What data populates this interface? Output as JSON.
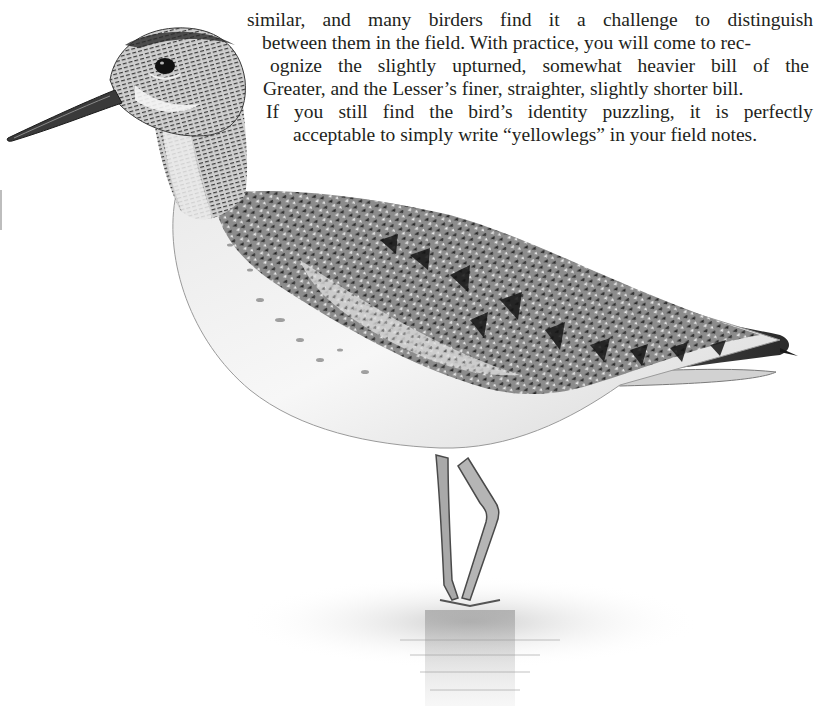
{
  "document": {
    "type": "field-guide-page",
    "subject_illustration": "yellowlegs-sandpiper-standing-in-shallow-water",
    "paragraph": {
      "lines": [
        "similar, and many birders find it a challenge to distinguish",
        "between them in the field. With practice, you will come to rec-",
        "ognize the slightly upturned, somewhat heavier bill of the",
        "Greater, and the Lesser’s finer, straighter, slightly shorter bill.",
        "If you still find the bird’s identity puzzling, it is perfectly",
        "acceptable to simply write “yellowlegs” in your field notes."
      ]
    }
  },
  "colors": {
    "background": "#ffffff",
    "text": "#231f20",
    "ink_dark": "#1a1a1a",
    "ink_mid": "#6b6b6b",
    "ink_light": "#bcbcbc"
  }
}
